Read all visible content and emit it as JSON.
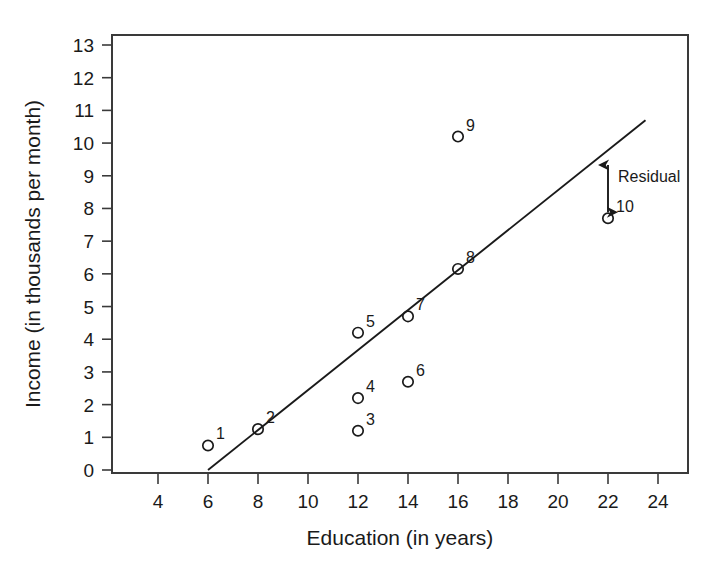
{
  "chart_data": {
    "type": "scatter",
    "title": "",
    "xlabel": "Education (in years)",
    "ylabel": "Income (in thousands per month)",
    "xlim": [
      3,
      25
    ],
    "ylim": [
      0,
      13.3
    ],
    "xticks": [
      4,
      6,
      8,
      10,
      12,
      14,
      16,
      18,
      20,
      22,
      24
    ],
    "yticks": [
      0,
      1,
      2,
      3,
      4,
      5,
      6,
      7,
      8,
      9,
      10,
      11,
      12,
      13
    ],
    "grid": false,
    "legend": null,
    "points": [
      {
        "label": "1",
        "x": 6,
        "y": 0.75
      },
      {
        "label": "2",
        "x": 8,
        "y": 1.25
      },
      {
        "label": "3",
        "x": 12,
        "y": 1.2
      },
      {
        "label": "4",
        "x": 12,
        "y": 2.2
      },
      {
        "label": "5",
        "x": 12,
        "y": 4.2
      },
      {
        "label": "6",
        "x": 14,
        "y": 2.7
      },
      {
        "label": "7",
        "x": 14,
        "y": 4.7
      },
      {
        "label": "8",
        "x": 16,
        "y": 6.15
      },
      {
        "label": "9",
        "x": 16,
        "y": 10.2
      },
      {
        "label": "10",
        "x": 22,
        "y": 7.7
      }
    ],
    "regression_line": {
      "x0": 6,
      "y0": 0,
      "x1": 23.5,
      "y1": 10.7
    },
    "annotations": [
      {
        "text": "Residual",
        "type": "double-arrow",
        "x": 22,
        "y_from": 7.7,
        "y_to": 9.45
      }
    ]
  },
  "axis": {
    "x_title": "Education (in years)",
    "y_title": "Income (in thousands per month)",
    "x_tick_labels": [
      "4",
      "6",
      "8",
      "10",
      "12",
      "14",
      "16",
      "18",
      "20",
      "22",
      "24"
    ],
    "y_tick_labels": [
      "0",
      "1",
      "2",
      "3",
      "4",
      "5",
      "6",
      "7",
      "8",
      "9",
      "10",
      "11",
      "12",
      "13"
    ]
  },
  "colors": {
    "ink": "#1a1a1a",
    "frame": "#3a3a3a",
    "background": "#ffffff"
  }
}
